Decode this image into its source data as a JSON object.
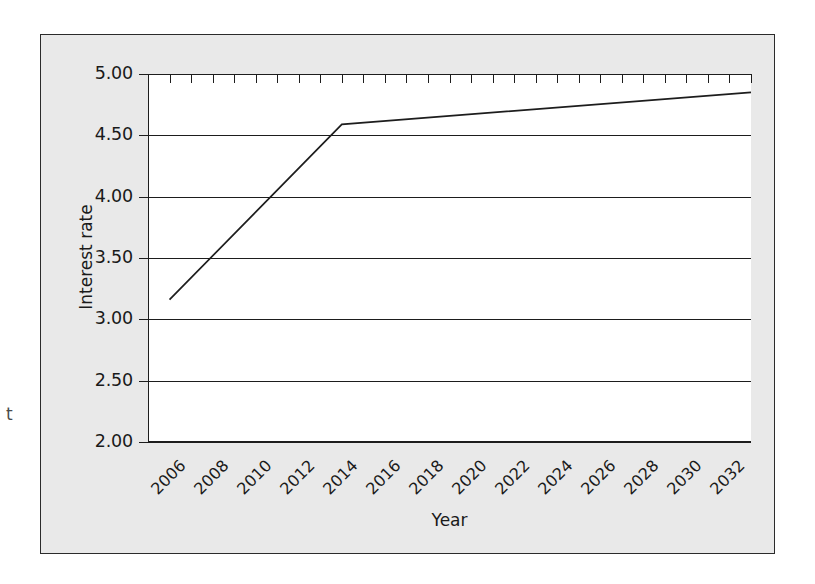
{
  "chart_data": {
    "type": "line",
    "title": "",
    "subtitle": "",
    "xlabel": "Year",
    "ylabel": "Interest rate",
    "grid": "horizontal",
    "legend": "none",
    "xlim": [
      2005,
      2033
    ],
    "ylim": [
      2.0,
      5.0
    ],
    "y_ticks": [
      "5.00",
      "4.50",
      "4.00",
      "3.50",
      "3.00",
      "2.50",
      "2.00"
    ],
    "y_tick_values": [
      5.0,
      4.5,
      4.0,
      3.5,
      3.0,
      2.5,
      2.0
    ],
    "x_tick_labels": [
      "2006",
      "2008",
      "2010",
      "2012",
      "2014",
      "2016",
      "2018",
      "2020",
      "2022",
      "2024",
      "2026",
      "2028",
      "2030",
      "2032"
    ],
    "x_tick_label_values": [
      2006,
      2008,
      2010,
      2012,
      2014,
      2016,
      2018,
      2020,
      2022,
      2024,
      2026,
      2028,
      2030,
      2032
    ],
    "x_minor_tick_values": [
      2005,
      2006,
      2007,
      2008,
      2009,
      2010,
      2011,
      2012,
      2013,
      2014,
      2015,
      2016,
      2017,
      2018,
      2019,
      2020,
      2021,
      2022,
      2023,
      2024,
      2025,
      2026,
      2027,
      2028,
      2029,
      2030,
      2031,
      2032,
      2033
    ],
    "series": [
      {
        "name": "Interest rate",
        "color": "#1d1d1d",
        "x": [
          2006,
          2014,
          2033
        ],
        "values": [
          3.16,
          4.59,
          4.85
        ]
      }
    ]
  },
  "margin_glyph": "t"
}
